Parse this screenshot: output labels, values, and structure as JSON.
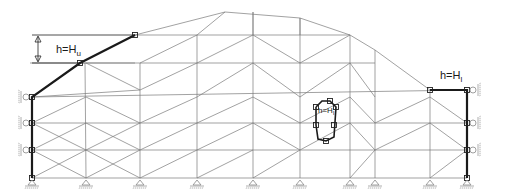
{
  "diagram": {
    "width": 508,
    "height": 195,
    "colors": {
      "mesh": "#7a7a7a",
      "boundary": "#1a1a1a",
      "support": "#888888"
    },
    "labels": {
      "upper": {
        "text": "h=H",
        "sub": "u",
        "x": 56,
        "y": 53
      },
      "lower": {
        "text": "h=H",
        "sub": "l",
        "x": 440,
        "y": 79
      },
      "inner": {
        "text": "h=H",
        "sub": "l",
        "x": 318,
        "y": 113
      }
    },
    "dimension": {
      "x": 38,
      "y1": 35,
      "y2": 63,
      "ext_x1": 32,
      "ext_x2": 135
    },
    "mesh_lines": [
      [
        32,
        97,
        80,
        63
      ],
      [
        80,
        63,
        135,
        35
      ],
      [
        135,
        35,
        225,
        12
      ],
      [
        225,
        12,
        300,
        18
      ],
      [
        300,
        18,
        350,
        35
      ],
      [
        350,
        35,
        375,
        50
      ],
      [
        375,
        50,
        430,
        90
      ],
      [
        32,
        97,
        467,
        90
      ],
      [
        32,
        123,
        467,
        123
      ],
      [
        32,
        150,
        467,
        150
      ],
      [
        32,
        178,
        467,
        178
      ],
      [
        30,
        63,
        135,
        63
      ],
      [
        135,
        35,
        300,
        35
      ],
      [
        300,
        35,
        350,
        35
      ],
      [
        80,
        63,
        375,
        63
      ],
      [
        85,
        63,
        86,
        178
      ],
      [
        140,
        63,
        140,
        178
      ],
      [
        197,
        35,
        197,
        178
      ],
      [
        253,
        12,
        253,
        178
      ],
      [
        300,
        18,
        300,
        178
      ],
      [
        350,
        35,
        350,
        178
      ],
      [
        375,
        50,
        375,
        178
      ],
      [
        430,
        90,
        430,
        178
      ],
      [
        32,
        97,
        140,
        90
      ],
      [
        32,
        123,
        86,
        97
      ],
      [
        32,
        150,
        86,
        123
      ],
      [
        32,
        178,
        86,
        150
      ],
      [
        86,
        63,
        140,
        90
      ],
      [
        140,
        90,
        197,
        63
      ],
      [
        197,
        63,
        253,
        35
      ],
      [
        253,
        35,
        300,
        63
      ],
      [
        300,
        63,
        350,
        35
      ],
      [
        86,
        97,
        140,
        123
      ],
      [
        140,
        123,
        197,
        97
      ],
      [
        197,
        97,
        253,
        63
      ],
      [
        253,
        63,
        300,
        97
      ],
      [
        300,
        97,
        350,
        63
      ],
      [
        350,
        63,
        375,
        97
      ],
      [
        86,
        123,
        140,
        150
      ],
      [
        140,
        150,
        197,
        123
      ],
      [
        197,
        123,
        253,
        97
      ],
      [
        253,
        97,
        300,
        123
      ],
      [
        300,
        123,
        350,
        97
      ],
      [
        350,
        97,
        375,
        123
      ],
      [
        375,
        123,
        430,
        97
      ],
      [
        430,
        97,
        467,
        123
      ],
      [
        86,
        150,
        140,
        178
      ],
      [
        140,
        178,
        197,
        150
      ],
      [
        197,
        150,
        253,
        123
      ],
      [
        253,
        123,
        300,
        150
      ],
      [
        300,
        150,
        350,
        123
      ],
      [
        350,
        123,
        375,
        150
      ],
      [
        375,
        150,
        430,
        123
      ],
      [
        430,
        123,
        467,
        150
      ],
      [
        86,
        178,
        140,
        150
      ],
      [
        197,
        178,
        253,
        150
      ],
      [
        253,
        178,
        300,
        150
      ],
      [
        350,
        178,
        375,
        150
      ],
      [
        430,
        178,
        467,
        150
      ],
      [
        32,
        123,
        86,
        150
      ],
      [
        32,
        150,
        86,
        178
      ],
      [
        86,
        150,
        140,
        123
      ],
      [
        140,
        63,
        197,
        35
      ],
      [
        197,
        35,
        225,
        12
      ],
      [
        253,
        12,
        253,
        35
      ],
      [
        300,
        18,
        300,
        35
      ]
    ],
    "boundary": {
      "upper": [
        [
          32,
          178
        ],
        [
          32,
          97
        ],
        [
          80,
          63
        ],
        [
          135,
          35
        ]
      ],
      "lower": [
        [
          430,
          90
        ],
        [
          467,
          90
        ],
        [
          467,
          178
        ]
      ],
      "inner": [
        [
          316,
          107
        ],
        [
          322,
          101
        ],
        [
          330,
          101
        ],
        [
          336,
          107
        ],
        [
          334,
          137
        ],
        [
          326,
          141
        ],
        [
          318,
          139
        ],
        [
          316,
          125
        ],
        [
          316,
          107
        ]
      ]
    },
    "nodes": [
      [
        32,
        97
      ],
      [
        32,
        123
      ],
      [
        32,
        150
      ],
      [
        32,
        178
      ],
      [
        80,
        63
      ],
      [
        135,
        35
      ],
      [
        430,
        90
      ],
      [
        467,
        90
      ],
      [
        467,
        123
      ],
      [
        467,
        150
      ],
      [
        467,
        178
      ],
      [
        316,
        107
      ],
      [
        330,
        101
      ],
      [
        336,
        107
      ],
      [
        334,
        125
      ],
      [
        326,
        141
      ],
      [
        316,
        125
      ]
    ],
    "roller_supports_left": [
      97,
      123,
      150
    ],
    "roller_supports_right": [
      90,
      123,
      150
    ],
    "pin_supports": [
      32,
      86,
      140,
      197,
      253,
      300,
      350,
      375,
      430,
      467
    ],
    "ground_y": 180
  }
}
